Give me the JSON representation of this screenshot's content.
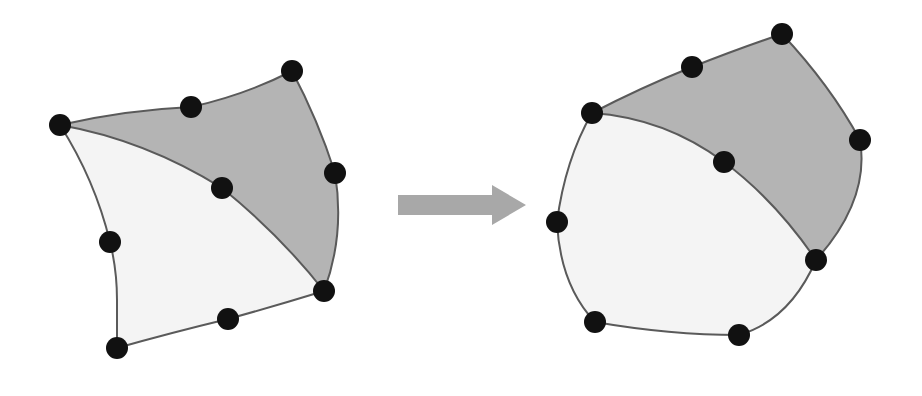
{
  "figure": {
    "colors": {
      "background": "#ffffff",
      "light_region": "#f4f4f4",
      "shaded_region": "#b4b4b4",
      "edge": "#5a5a5a",
      "node": "#111111",
      "arrow": "#a8a8a8"
    },
    "node_radius": 11,
    "before": {
      "nodes": [
        {
          "id": "A",
          "x": 60,
          "y": 125
        },
        {
          "id": "B",
          "x": 191,
          "y": 107
        },
        {
          "id": "C",
          "x": 292,
          "y": 71
        },
        {
          "id": "D",
          "x": 335,
          "y": 173
        },
        {
          "id": "E",
          "x": 324,
          "y": 291
        },
        {
          "id": "F",
          "x": 228,
          "y": 319
        },
        {
          "id": "G",
          "x": 117,
          "y": 348
        },
        {
          "id": "H",
          "x": 110,
          "y": 242
        },
        {
          "id": "I",
          "x": 222,
          "y": 188
        }
      ],
      "shaded_path": "M60,125 Q125,110 191,107 Q245,95 292,71 Q318,120 335,173 Q345,235 324,291 Q280,235 222,188 Q145,140 60,125 Z",
      "light_path": "M60,125 Q145,140 222,188 Q280,235 324,291 Q275,306 228,319 Q170,333 117,348 L117,300 Q117,270 110,242 Q95,180 60,125 Z",
      "outer_path": "M60,125 Q125,110 191,107 Q245,95 292,71 Q318,120 335,173 Q345,235 324,291 Q275,306 228,319 Q170,333 117,348 L117,300 Q117,270 110,242 Q95,180 60,125 Z",
      "inner_path": "M60,125 Q145,140 222,188 Q280,235 324,291"
    },
    "after": {
      "nodes": [
        {
          "id": "A",
          "x": 592,
          "y": 113
        },
        {
          "id": "B",
          "x": 692,
          "y": 67
        },
        {
          "id": "C",
          "x": 782,
          "y": 34
        },
        {
          "id": "D",
          "x": 860,
          "y": 140
        },
        {
          "id": "E",
          "x": 816,
          "y": 260
        },
        {
          "id": "F",
          "x": 739,
          "y": 335
        },
        {
          "id": "G",
          "x": 595,
          "y": 322
        },
        {
          "id": "H",
          "x": 557,
          "y": 222
        },
        {
          "id": "I",
          "x": 724,
          "y": 162
        }
      ],
      "shaded_path": "M592,113 Q640,88 692,67 Q740,48 782,34 Q830,85 860,140 Q870,200 816,260 Q775,200 724,162 Q665,118 592,113 Z",
      "light_path": "M592,113 Q665,118 724,162 Q775,200 816,260 Q790,320 739,335 Q670,335 595,322 Q560,285 557,222 Q565,160 592,113 Z",
      "outer_path": "M592,113 Q640,88 692,67 Q740,48 782,34 Q830,85 860,140 Q870,200 816,260 Q790,320 739,335 Q670,335 595,322 Q560,285 557,222 Q565,160 592,113 Z",
      "inner_path": "M592,113 Q665,118 724,162 Q775,200 816,260"
    },
    "arrow": {
      "points": "398,195 492,195 492,185 526,205 492,225 492,215 398,215"
    }
  }
}
